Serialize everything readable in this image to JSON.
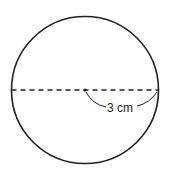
{
  "diagram": {
    "shape": "circle",
    "radius_label": "3 cm",
    "line_style": "dashed diameter",
    "stroke_color": "#231f20"
  }
}
